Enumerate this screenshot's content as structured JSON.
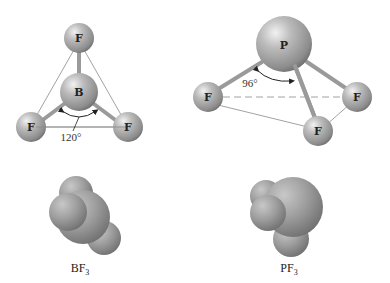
{
  "bf3": {
    "central_atom": "B",
    "ligand_atom": "F",
    "bond_angle": "120°",
    "formula_main": "BF",
    "formula_sub": "3"
  },
  "pf3": {
    "central_atom": "P",
    "ligand_atom": "F",
    "bond_angle": "96°",
    "formula_main": "PF",
    "formula_sub": "3"
  },
  "colors": {
    "atom_fill": "#a8a8a8",
    "atom_shadow": "#7a7a7a",
    "guide_line": "#888888",
    "background": "#ffffff"
  }
}
